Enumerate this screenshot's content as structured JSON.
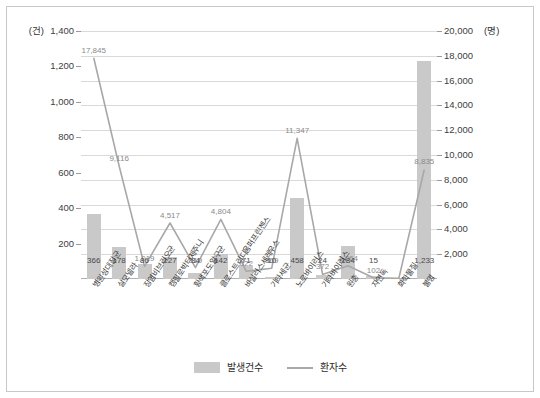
{
  "chart_data": {
    "type": "bar",
    "title": "",
    "subtitle": "",
    "xlabel": "",
    "ylabel": "",
    "grid": true,
    "legend_position": "bottom",
    "left_axis": {
      "unit": "(건)",
      "min": 0,
      "max": 1400,
      "ticks": [
        "1,400",
        "1,200",
        "1,000",
        "800",
        "600",
        "400",
        "200"
      ],
      "tick_values": [
        1400,
        1200,
        1000,
        800,
        600,
        400,
        200
      ]
    },
    "right_axis": {
      "unit": "(명)",
      "min": 0,
      "max": 20000,
      "ticks": [
        "20,000",
        "18,000",
        "16,000",
        "14,000",
        "12,000",
        "10,000",
        "8,000",
        "6,000",
        "4,000",
        "2,000"
      ],
      "tick_values": [
        20000,
        18000,
        16000,
        14000,
        12000,
        10000,
        8000,
        6000,
        4000,
        2000
      ]
    },
    "categories": [
      "병원성대장균",
      "살모넬라",
      "장염비브리오균",
      "캠필로박터제주니",
      "황색포도알구균",
      "클로스트리디움퍼프린젠스",
      "바실러스세레우스",
      "기타세균",
      "노로바이러스",
      "기타바이러스",
      "원충",
      "자연독",
      "화학물질",
      "불명"
    ],
    "series": [
      {
        "name": "발생건수",
        "kind": "bar",
        "axis": "left",
        "color": "#c9c9c9",
        "values": [
          366,
          178,
          86,
          127,
          34,
          142,
          71,
          10,
          458,
          24,
          184,
          15,
          0,
          1233
        ],
        "labels": [
          "366",
          "178",
          "86",
          "127",
          "34",
          "142",
          "71",
          "10",
          "458",
          "24",
          "184",
          "15",
          "",
          "1,233"
        ]
      },
      {
        "name": "환자수",
        "kind": "line",
        "axis": "right",
        "color": "#a8a8a8",
        "values": [
          17845,
          9116,
          1019,
          4517,
          919,
          4804,
          622,
          869,
          11347,
          372,
          1064,
          102,
          60,
          8835
        ],
        "labels": [
          "17,845",
          "9,116",
          "1,019",
          "4,517",
          "919",
          "4,804",
          "622",
          "869",
          "11,347",
          "372",
          "1,064",
          "102",
          "",
          "8,835"
        ]
      }
    ]
  },
  "legend": {
    "items": [
      {
        "label": "발생건수",
        "marker": "bar-swatch"
      },
      {
        "label": "환자수",
        "marker": "line-swatch"
      }
    ]
  }
}
